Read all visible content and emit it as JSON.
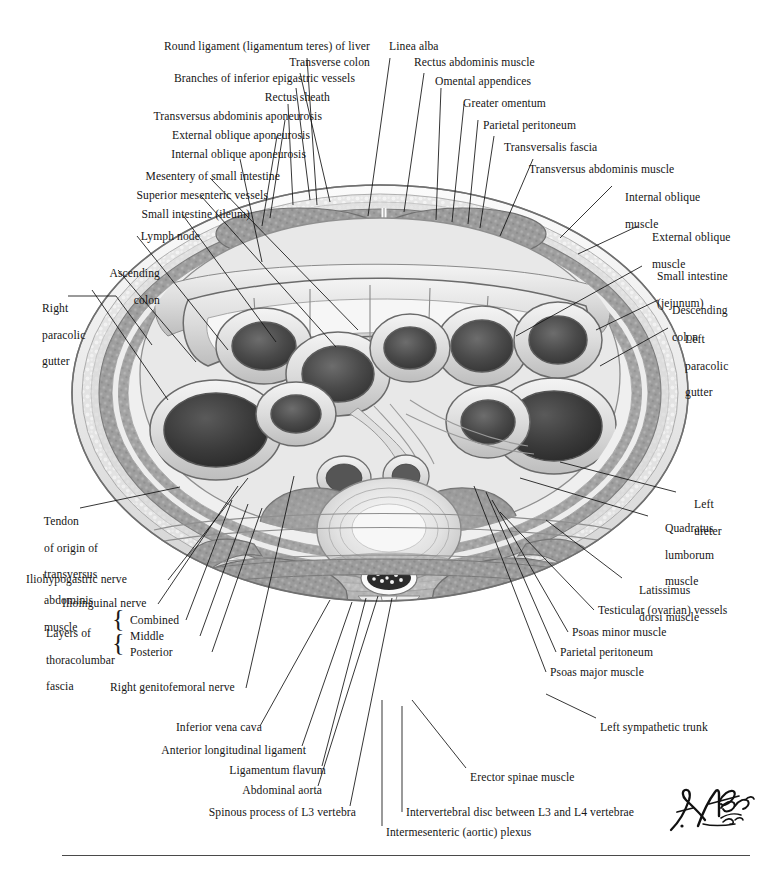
{
  "plate": {
    "title": "Cross Section of Abdomen at L3-L4 Intervertebral Disc Level",
    "signature": "F. Netter M.D.",
    "ink_color": "#151515",
    "background": "#ffffff"
  },
  "labels": {
    "top_left": [
      {
        "id": "round-ligament",
        "text": "Round ligament (ligamentum teres) of liver"
      },
      {
        "id": "transverse-colon",
        "text": "Transverse colon"
      },
      {
        "id": "inferior-epigastric",
        "text": "Branches of inferior epigastric vessels"
      },
      {
        "id": "rectus-sheath",
        "text": "Rectus sheath"
      },
      {
        "id": "transversus-aponeurosis",
        "text": "Transversus abdominis aponeurosis"
      },
      {
        "id": "external-oblique-apo",
        "text": "External oblique aponeurosis"
      },
      {
        "id": "internal-oblique-apo",
        "text": "Internal oblique aponeurosis"
      },
      {
        "id": "mesentery",
        "text": "Mesentery of small intestine"
      },
      {
        "id": "superior-mesenteric",
        "text": "Superior mesenteric vessels"
      },
      {
        "id": "small-intestine-ileum",
        "text": "Small intestine (ileum)"
      },
      {
        "id": "lymph-node",
        "text": "Lymph node"
      }
    ],
    "left": [
      {
        "id": "ascending-colon",
        "lines": [
          "Ascending",
          "colon"
        ]
      },
      {
        "id": "right-paracolic-gutter",
        "lines": [
          "Right",
          "paracolic",
          "gutter"
        ]
      }
    ],
    "top_right": [
      {
        "id": "linea-alba",
        "text": "Linea alba"
      },
      {
        "id": "rectus-abdominis",
        "text": "Rectus abdominis muscle"
      },
      {
        "id": "omental-appendices",
        "text": "Omental appendices"
      },
      {
        "id": "greater-omentum",
        "text": "Greater omentum"
      },
      {
        "id": "parietal-peritoneum-t",
        "text": "Parietal peritoneum"
      },
      {
        "id": "transversalis-fascia",
        "text": "Transversalis fascia"
      },
      {
        "id": "transversus-muscle",
        "text": "Transversus abdominis muscle"
      }
    ],
    "right": [
      {
        "id": "internal-oblique-muscle",
        "lines": [
          "Internal oblique",
          "muscle"
        ]
      },
      {
        "id": "external-oblique-muscle",
        "lines": [
          "External oblique",
          "muscle"
        ]
      },
      {
        "id": "small-intestine-jejunum",
        "lines": [
          "Small intestine",
          "(jejunum)"
        ]
      },
      {
        "id": "descending-colon",
        "lines": [
          "Descending",
          "colon"
        ]
      },
      {
        "id": "left-paracolic-gutter",
        "lines": [
          "Left",
          "paracolic",
          "gutter"
        ]
      },
      {
        "id": "left-ureter",
        "lines": [
          "Left",
          "ureter"
        ]
      },
      {
        "id": "quadratus-lumborum",
        "lines": [
          "Quadratus",
          "lumborum",
          "muscle"
        ]
      },
      {
        "id": "latissimus-dorsi",
        "lines": [
          "Latissimus",
          "dorsi muscle"
        ]
      },
      {
        "id": "testicular-vessels",
        "lines": [
          "Testicular (ovarian) vessels"
        ]
      },
      {
        "id": "psoas-minor",
        "lines": [
          "Psoas minor muscle"
        ]
      },
      {
        "id": "parietal-peritoneum-b",
        "lines": [
          "Parietal peritoneum"
        ]
      },
      {
        "id": "psoas-major",
        "lines": [
          "Psoas major muscle"
        ]
      },
      {
        "id": "left-sympathetic-trunk",
        "lines": [
          "Left sympathetic trunk"
        ]
      },
      {
        "id": "erector-spinae",
        "lines": [
          "Erector spinae muscle"
        ]
      },
      {
        "id": "intervertebral-disc",
        "lines": [
          "Intervertebral disc between L3 and L4 vertebrae"
        ]
      }
    ],
    "lower_left": [
      {
        "id": "tendon-of-origin",
        "lines": [
          "Tendon",
          "of origin of",
          "transversus",
          "abdominis",
          "muscle"
        ]
      },
      {
        "id": "iliohypogastric",
        "lines": [
          "Iliohypogastric nerve"
        ]
      },
      {
        "id": "ilioinguinal",
        "lines": [
          "Ilioinguinal nerve"
        ]
      },
      {
        "id": "thoracolumbar",
        "lines": [
          "Layers of",
          "thoracolumbar",
          "fascia"
        ]
      },
      {
        "id": "genitofemoral",
        "lines": [
          "Right genitofemoral nerve"
        ]
      }
    ],
    "thoracolumbar_layers": [
      {
        "id": "layer-combined",
        "text": "Combined"
      },
      {
        "id": "layer-middle",
        "text": "Middle"
      },
      {
        "id": "layer-posterior",
        "text": "Posterior"
      }
    ],
    "bottom": [
      {
        "id": "inferior-vena-cava",
        "text": "Inferior vena cava"
      },
      {
        "id": "ant-long-ligament",
        "text": "Anterior longitudinal ligament"
      },
      {
        "id": "ligamentum-flavum",
        "text": "Ligamentum flavum"
      },
      {
        "id": "abdominal-aorta",
        "text": "Abdominal aorta"
      },
      {
        "id": "spinous-process",
        "text": "Spinous process of L3 vertebra"
      },
      {
        "id": "intermesenteric",
        "text": "Intermesenteric (aortic) plexus"
      }
    ]
  }
}
